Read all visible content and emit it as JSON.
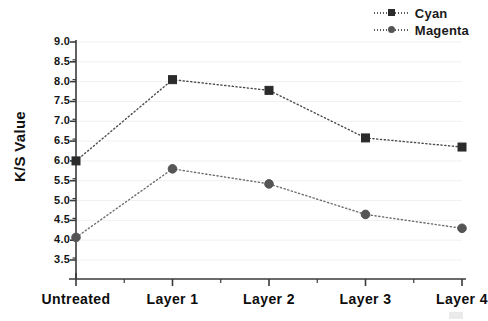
{
  "chart_data": {
    "type": "line",
    "title": "",
    "subtitle": "",
    "xlabel": "",
    "ylabel": "K/S Value",
    "categories": [
      "Untreated",
      "Layer 1",
      "Layer 2",
      "Layer 3",
      "Layer 4"
    ],
    "series": [
      {
        "name": "Cyan",
        "marker": "square",
        "color": "#2b2b2b",
        "linestyle": "dotted",
        "values": [
          6.0,
          8.05,
          7.78,
          6.58,
          6.35
        ]
      },
      {
        "name": "Magenta",
        "marker": "circle",
        "color": "#555555",
        "linestyle": "dotted",
        "values": [
          4.07,
          5.8,
          5.42,
          4.65,
          4.3
        ]
      }
    ],
    "ylim": [
      3.3,
      9.0
    ],
    "yticks": [
      3.5,
      4.0,
      4.5,
      5.0,
      5.5,
      6.0,
      6.5,
      7.0,
      7.5,
      8.0,
      8.5,
      9.0
    ],
    "ytick_labels": [
      "3.5",
      "4.0",
      "4.5",
      "5.0",
      "5.5",
      "6.0",
      "6.5",
      "7.0",
      "7.5",
      "8.0",
      "8.5",
      "9.0"
    ],
    "minor_yticks": true,
    "grid": true,
    "grid_color": "#f0f0f2",
    "legend_position": "top-right",
    "axis_color": "#3a3a3a",
    "background": "#ffffff"
  },
  "legend": {
    "items": [
      {
        "label": "Cyan"
      },
      {
        "label": "Magenta"
      }
    ]
  },
  "axes": {
    "y_title": "K/S Value"
  }
}
